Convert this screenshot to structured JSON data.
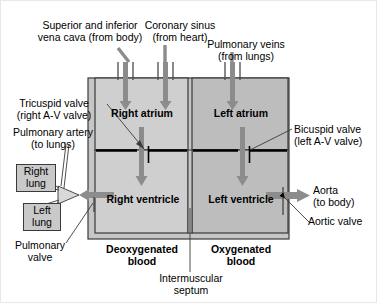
{
  "diagram": {
    "colors": {
      "outer_wall": "#c6c6c6",
      "right_chamber": "#cfcfcf",
      "left_chamber": "#bdbdbd",
      "arrow_gray": "#8c8c8c",
      "valve_black": "#000000",
      "outline": "#3a3a3a",
      "lung_box": "#c9c9c9",
      "background": "#ffffff"
    },
    "chambers": [
      {
        "id": "right-atrium",
        "label": "Right atrium"
      },
      {
        "id": "left-atrium",
        "label": "Left atrium"
      },
      {
        "id": "right-ventricle",
        "label": "Right ventricle"
      },
      {
        "id": "left-ventricle",
        "label": "Left ventricle"
      }
    ],
    "labels": {
      "vena_cava": "Superior and inferior\nvena cava (from body)",
      "coronary_sinus": "Coronary sinus\n(from heart)",
      "pulmonary_veins": "Pulmonary veins\n(from lungs)",
      "tricuspid_valve": "Tricuspid valve\n(right A-V valve)",
      "pulmonary_artery": "Pulmonary artery\n(to lungs)",
      "bicuspid_valve": "Bicuspid valve\n(left A-V valve)",
      "aorta": "Aorta\n(to body)",
      "aortic_valve": "Aortic valve",
      "pulmonary_valve": "Pulmonary\nvalve",
      "right_lung": "Right\nlung",
      "left_lung": "Left\nlung",
      "deoxygenated_blood": "Deoxygenated\nblood",
      "oxygenated_blood": "Oxygenated\nblood",
      "intermuscular_septum": "Intermuscular\nseptum"
    },
    "flow_arrows": [
      {
        "id": "vena-cava-inflow",
        "direction": "down",
        "target": "right-atrium"
      },
      {
        "id": "coronary-sinus-inflow",
        "direction": "down",
        "target": "right-atrium"
      },
      {
        "id": "pulmonary-veins-inflow",
        "direction": "down",
        "target": "left-atrium"
      },
      {
        "id": "right-av-flow",
        "direction": "down",
        "target": "right-ventricle"
      },
      {
        "id": "left-av-flow",
        "direction": "down",
        "target": "left-ventricle"
      },
      {
        "id": "pulmonary-artery-outflow",
        "direction": "left",
        "target": "lungs"
      },
      {
        "id": "aorta-outflow",
        "direction": "right",
        "target": "body"
      }
    ]
  }
}
